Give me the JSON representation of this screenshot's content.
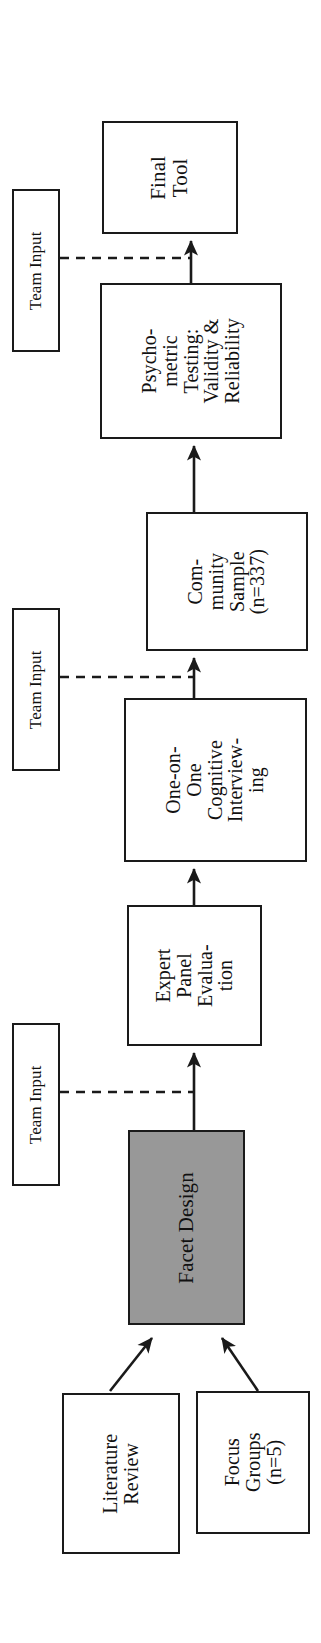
{
  "diagram": {
    "orientation": "bottom-to-top, labels rotated 90 degrees counter-clockwise",
    "colors": {
      "stroke": "#1a1a1a",
      "node_fill": "#ffffff",
      "highlight_fill": "#989898",
      "text": "#111111",
      "background": "#ffffff"
    },
    "nodes": {
      "final_tool": {
        "label": "Final\nTool",
        "fill": "white"
      },
      "psychometric": {
        "label": "Psycho-\nmetric\nTesting:\nValidity &\nReliability",
        "fill": "white"
      },
      "community": {
        "label": "Com-\nmunity\nSample\n(n=337)",
        "fill": "white"
      },
      "cognitive": {
        "label": "One-on-\nOne\nCognitive\nInterview-\ning",
        "fill": "white"
      },
      "expert": {
        "label": "Expert\nPanel\nEvalua-\ntion",
        "fill": "white"
      },
      "facet": {
        "label": "Facet Design",
        "fill": "gray"
      },
      "literature": {
        "label": "Literature\nReview",
        "fill": "white"
      },
      "focus": {
        "label": "Focus\nGroups\n(n=5)",
        "fill": "white"
      }
    },
    "team_inputs": {
      "top": {
        "label": "Team Input"
      },
      "middle": {
        "label": "Team Input"
      },
      "bottom": {
        "label": "Team Input"
      }
    },
    "edges": [
      {
        "from": "literature",
        "to": "facet",
        "style": "solid-arrow"
      },
      {
        "from": "focus",
        "to": "facet",
        "style": "solid-arrow"
      },
      {
        "from": "facet",
        "to": "expert",
        "style": "solid-arrow"
      },
      {
        "from": "expert",
        "to": "cognitive",
        "style": "solid-arrow"
      },
      {
        "from": "cognitive",
        "to": "community",
        "style": "solid-arrow"
      },
      {
        "from": "community",
        "to": "psychometric",
        "style": "solid-arrow"
      },
      {
        "from": "psychometric",
        "to": "final_tool",
        "style": "solid-arrow"
      },
      {
        "from": "team_input_bottom",
        "to": "facet-to-expert-edge",
        "style": "dashed"
      },
      {
        "from": "team_input_middle",
        "to": "cognitive-to-community-edge",
        "style": "dashed"
      },
      {
        "from": "team_input_top",
        "to": "psychometric-to-final-edge",
        "style": "dashed"
      }
    ]
  }
}
